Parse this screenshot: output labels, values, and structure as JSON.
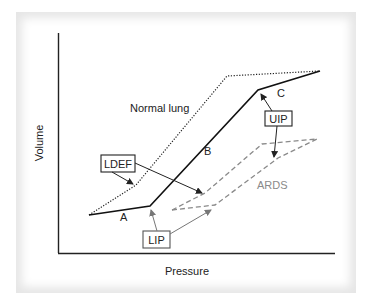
{
  "diagram": {
    "axes": {
      "xlabel": "Pressure",
      "ylabel": "Volume"
    },
    "curves": {
      "normal": {
        "label": "Normal lung",
        "style": "dotted",
        "color": "#222222"
      },
      "solid": {
        "style": "solid",
        "color": "#111111"
      },
      "ards": {
        "label": "ARDS",
        "style": "dashed",
        "color": "#8a8a8a"
      }
    },
    "segment_labels": {
      "a": "A",
      "b": "B",
      "c": "C"
    },
    "callouts": {
      "ldef": "LDEF",
      "uip": "UIP",
      "lip": "LIP"
    }
  }
}
